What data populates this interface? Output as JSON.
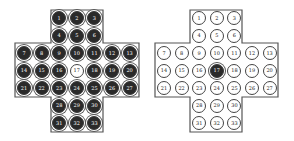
{
  "boards": [
    {
      "name": "initial-position",
      "empty_holes": [
        17
      ],
      "outline_color": "#555555"
    },
    {
      "name": "final-position",
      "filled_holes": [
        17
      ],
      "outline_color": "#555555"
    }
  ],
  "holes": [
    {
      "n": "1",
      "r": 0,
      "c": 2
    },
    {
      "n": "2",
      "r": 0,
      "c": 3
    },
    {
      "n": "3",
      "r": 0,
      "c": 4
    },
    {
      "n": "4",
      "r": 1,
      "c": 2
    },
    {
      "n": "5",
      "r": 1,
      "c": 3
    },
    {
      "n": "6",
      "r": 1,
      "c": 4
    },
    {
      "n": "7",
      "r": 2,
      "c": 0
    },
    {
      "n": "8",
      "r": 2,
      "c": 1
    },
    {
      "n": "9",
      "r": 2,
      "c": 2
    },
    {
      "n": "10",
      "r": 2,
      "c": 3
    },
    {
      "n": "11",
      "r": 2,
      "c": 4
    },
    {
      "n": "12",
      "r": 2,
      "c": 5
    },
    {
      "n": "13",
      "r": 2,
      "c": 6
    },
    {
      "n": "14",
      "r": 3,
      "c": 0
    },
    {
      "n": "15",
      "r": 3,
      "c": 1
    },
    {
      "n": "16",
      "r": 3,
      "c": 2
    },
    {
      "n": "17",
      "r": 3,
      "c": 3
    },
    {
      "n": "18",
      "r": 3,
      "c": 4
    },
    {
      "n": "19",
      "r": 3,
      "c": 5
    },
    {
      "n": "20",
      "r": 3,
      "c": 6
    },
    {
      "n": "21",
      "r": 4,
      "c": 0
    },
    {
      "n": "22",
      "r": 4,
      "c": 1
    },
    {
      "n": "23",
      "r": 4,
      "c": 2
    },
    {
      "n": "24",
      "r": 4,
      "c": 3
    },
    {
      "n": "25",
      "r": 4,
      "c": 4
    },
    {
      "n": "26",
      "r": 4,
      "c": 5
    },
    {
      "n": "27",
      "r": 4,
      "c": 6
    },
    {
      "n": "28",
      "r": 5,
      "c": 2
    },
    {
      "n": "29",
      "r": 5,
      "c": 3
    },
    {
      "n": "30",
      "r": 5,
      "c": 4
    },
    {
      "n": "31",
      "r": 6,
      "c": 2
    },
    {
      "n": "32",
      "r": 6,
      "c": 3
    },
    {
      "n": "33",
      "r": 6,
      "c": 4
    }
  ]
}
